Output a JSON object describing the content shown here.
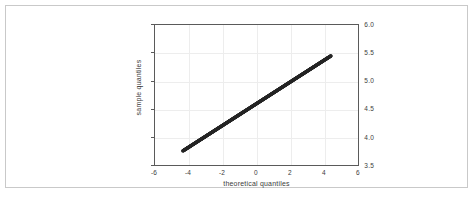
{
  "figure": {
    "background_color": "#ffffff",
    "border_color": "#c9c9c9",
    "axis_color": "#5a5a5a",
    "grid_color": "#ededed",
    "data_color": "#262626"
  },
  "chart_data": {
    "type": "scatter",
    "title": "",
    "xlabel": "theoretical quantiles",
    "ylabel": "sample quantiles",
    "xlim": [
      -6,
      6
    ],
    "ylim": [
      3.5,
      6.0
    ],
    "xticks": [
      -6,
      -4,
      -2,
      0,
      2,
      4,
      6
    ],
    "xtick_labels": [
      "-6",
      "-4",
      "-2",
      "0",
      "2",
      "4",
      "6"
    ],
    "yticks": [
      3.5,
      4.0,
      4.5,
      5.0,
      5.5,
      6.0
    ],
    "ytick_labels": [
      "3.5",
      "4.0",
      "4.5",
      "5.0",
      "5.5",
      "6.0"
    ],
    "grid": true,
    "legend": "none",
    "marker": "dot",
    "x": [
      -4.35,
      -4.1,
      -3.85,
      -3.6,
      -3.35,
      -3.1,
      -2.85,
      -2.6,
      -2.35,
      -2.1,
      -1.85,
      -1.6,
      -1.35,
      -1.1,
      -0.85,
      -0.6,
      -0.35,
      -0.1,
      0.15,
      0.4,
      0.65,
      0.9,
      1.15,
      1.4,
      1.65,
      1.9,
      2.15,
      2.4,
      2.65,
      2.9,
      3.15,
      3.4,
      3.65,
      3.9,
      4.15,
      4.4
    ],
    "y": [
      3.752,
      3.8,
      3.849,
      3.897,
      3.946,
      3.994,
      4.043,
      4.091,
      4.14,
      4.188,
      4.237,
      4.285,
      4.334,
      4.382,
      4.431,
      4.479,
      4.528,
      4.576,
      4.625,
      4.673,
      4.722,
      4.77,
      4.819,
      4.867,
      4.916,
      4.964,
      5.013,
      5.061,
      5.11,
      5.158,
      5.207,
      5.255,
      5.304,
      5.352,
      5.401,
      5.449
    ],
    "endpoints": {
      "lower_left": [
        -4.35,
        3.75
      ],
      "upper_right": [
        4.4,
        5.45
      ]
    }
  }
}
